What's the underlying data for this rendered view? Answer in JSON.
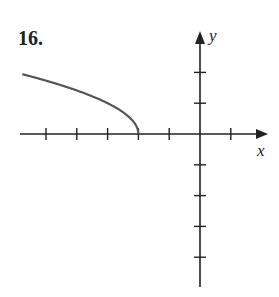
{
  "problem": {
    "number": "16."
  },
  "chart_data": {
    "type": "line",
    "title": "16.",
    "xlabel": "x",
    "ylabel": "y",
    "function_hint": "y = sqrt(-x - 2), x <= -2",
    "xlim": [
      -5.7,
      2.2
    ],
    "ylim": [
      -5,
      3.3
    ],
    "x_ticks": [
      -5,
      -4,
      -3,
      -2,
      -1,
      1
    ],
    "y_ticks": [
      2,
      1,
      -1,
      -2,
      -3,
      -4
    ],
    "tick_labels_shown": false,
    "grid": false,
    "series": [
      {
        "name": "curve",
        "color": "#555555",
        "x": [
          -5.7,
          -5.0,
          -4.0,
          -3.0,
          -2.5,
          -2.2,
          -2.05,
          -2.0
        ],
        "y": [
          1.92,
          1.73,
          1.41,
          1.0,
          0.71,
          0.45,
          0.22,
          0.0
        ]
      }
    ]
  },
  "style": {
    "axis_color": "#222222",
    "curve_color": "#555555"
  }
}
